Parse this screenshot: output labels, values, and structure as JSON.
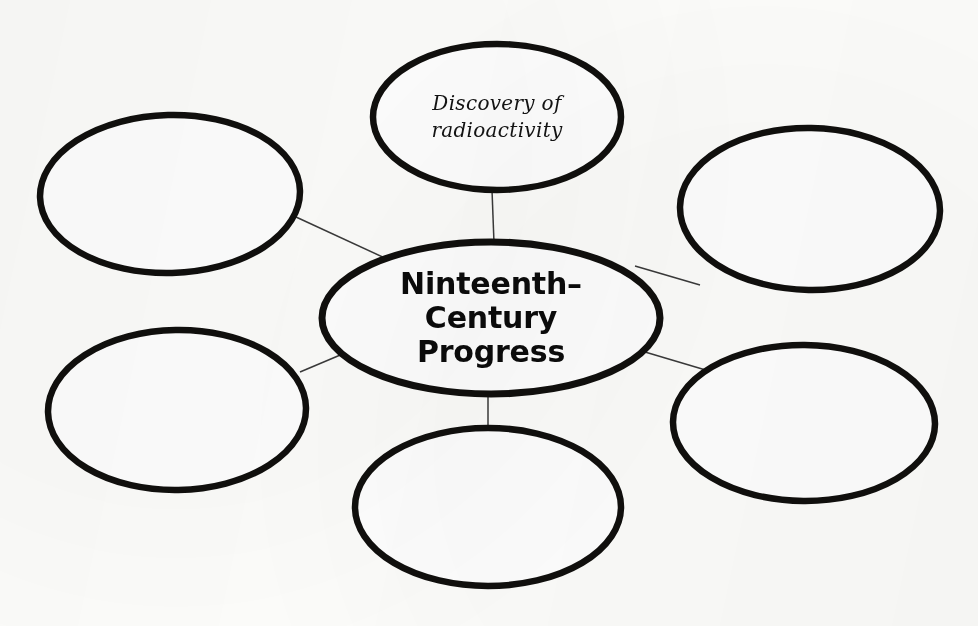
{
  "diagram": {
    "type": "concept-map",
    "title_node": {
      "id": "center",
      "text": "Ninteenth–Century Progress",
      "lines": [
        "Ninteenth–",
        "Century",
        "Progress"
      ],
      "style": "bold-print",
      "cx": 491,
      "cy": 318,
      "rx": 169,
      "ry": 76
    },
    "background_color": "#fdfdfb",
    "stroke_color": "#100f0d",
    "connector_color": "#3a3a3a",
    "nodes": [
      {
        "id": "top",
        "position": "top",
        "text": "Discovery of radioactivity",
        "lines": [
          "Discovery of",
          "radioactivity"
        ],
        "filled": true,
        "style": "handwriting",
        "cx": 497,
        "cy": 117,
        "rx": 124,
        "ry": 73
      },
      {
        "id": "top-left",
        "position": "top-left",
        "text": "",
        "lines": [],
        "filled": false,
        "style": "handwriting",
        "cx": 170,
        "cy": 194,
        "rx": 130,
        "ry": 79
      },
      {
        "id": "top-right",
        "position": "top-right",
        "text": "",
        "lines": [],
        "filled": false,
        "style": "handwriting",
        "cx": 810,
        "cy": 209,
        "rx": 130,
        "ry": 81
      },
      {
        "id": "bottom-left",
        "position": "bottom-left",
        "text": "",
        "lines": [],
        "filled": false,
        "style": "handwriting",
        "cx": 177,
        "cy": 410,
        "rx": 129,
        "ry": 80
      },
      {
        "id": "bottom-right",
        "position": "bottom-right",
        "text": "",
        "lines": [],
        "filled": false,
        "style": "handwriting",
        "cx": 804,
        "cy": 423,
        "rx": 131,
        "ry": 78
      },
      {
        "id": "bottom",
        "position": "bottom",
        "text": "",
        "lines": [],
        "filled": false,
        "style": "handwriting",
        "cx": 488,
        "cy": 507,
        "rx": 133,
        "ry": 79
      }
    ],
    "connectors": [
      {
        "id": "center-to-top",
        "from": "center",
        "to": "top",
        "x1": 494,
        "y1": 243,
        "x2": 492,
        "y2": 190
      },
      {
        "id": "center-to-top-left",
        "from": "center",
        "to": "top-left",
        "x1": 296,
        "y1": 217,
        "x2": 387,
        "y2": 259
      },
      {
        "id": "center-to-top-right",
        "from": "center",
        "to": "top-right",
        "x1": 635,
        "y1": 266,
        "x2": 700,
        "y2": 285
      },
      {
        "id": "center-to-bottom-left",
        "from": "center",
        "to": "bottom-left",
        "x1": 300,
        "y1": 372,
        "x2": 345,
        "y2": 353
      },
      {
        "id": "center-to-bottom-right",
        "from": "center",
        "to": "bottom-right",
        "x1": 645,
        "y1": 352,
        "x2": 709,
        "y2": 371
      },
      {
        "id": "center-to-bottom",
        "from": "center",
        "to": "bottom",
        "x1": 488,
        "y1": 394,
        "x2": 488,
        "y2": 429
      }
    ]
  }
}
